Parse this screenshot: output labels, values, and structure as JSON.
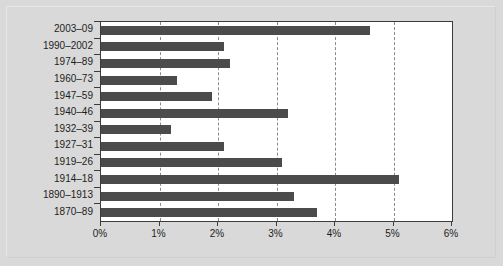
{
  "chart_data": {
    "type": "bar",
    "orientation": "horizontal",
    "title": "",
    "subtitle": "",
    "xlabel": "",
    "ylabel": "",
    "xlim": [
      0,
      6
    ],
    "ylim": null,
    "grid": "vertical-dashed",
    "legend": "none",
    "bar_color": "#4b4b4b",
    "plot_background": "#ffffff",
    "figure_background": "#d9d9d9",
    "axis_color": "#3c3c3c",
    "xticks": [
      0,
      1,
      2,
      3,
      4,
      5,
      6
    ],
    "xticklabels": [
      "0%",
      "1%",
      "2%",
      "3%",
      "4%",
      "5%",
      "6%"
    ],
    "categories": [
      "2003–09",
      "1990–2002",
      "1974–89",
      "1960–73",
      "1947–59",
      "1940–46",
      "1932–39",
      "1927–31",
      "1919–26",
      "1914–18",
      "1890–1913",
      "1870–89"
    ],
    "values": [
      4.6,
      2.1,
      2.2,
      1.3,
      1.9,
      3.2,
      1.2,
      2.1,
      3.1,
      5.1,
      3.3,
      3.7
    ],
    "series": [
      {
        "name": "",
        "values": [
          4.6,
          2.1,
          2.2,
          1.3,
          1.9,
          3.2,
          1.2,
          2.1,
          3.1,
          5.1,
          3.3,
          3.7
        ]
      }
    ]
  }
}
